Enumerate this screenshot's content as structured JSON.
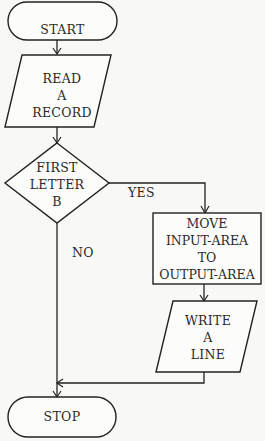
{
  "diagram": {
    "type": "flowchart",
    "nodes": [
      {
        "id": "start",
        "shape": "terminal",
        "lines": [
          "START"
        ]
      },
      {
        "id": "read",
        "shape": "parallelogram",
        "lines": [
          "READ",
          "A",
          "RECORD"
        ]
      },
      {
        "id": "decision",
        "shape": "diamond",
        "lines": [
          "FIRST",
          "LETTER",
          "B"
        ]
      },
      {
        "id": "move",
        "shape": "rectangle",
        "lines": [
          "MOVE",
          "INPUT-AREA",
          "TO",
          "OUTPUT-AREA"
        ]
      },
      {
        "id": "write",
        "shape": "parallelogram",
        "lines": [
          "WRITE",
          "A",
          "LINE"
        ]
      },
      {
        "id": "stop",
        "shape": "terminal",
        "lines": [
          "STOP"
        ]
      }
    ],
    "edges": [
      {
        "from": "start",
        "to": "read",
        "label": ""
      },
      {
        "from": "read",
        "to": "decision",
        "label": ""
      },
      {
        "from": "decision",
        "to": "move",
        "label": "YES"
      },
      {
        "from": "decision",
        "to": "stop",
        "label": "NO"
      },
      {
        "from": "move",
        "to": "write",
        "label": ""
      },
      {
        "from": "write",
        "to": "stop",
        "label": ""
      }
    ],
    "labels": {
      "yes": "YES",
      "no": "NO"
    }
  }
}
